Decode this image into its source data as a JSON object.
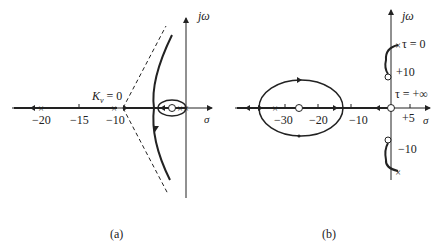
{
  "figure": {
    "type": "root-locus-diagrams",
    "panels": [
      {
        "id": "a",
        "caption": "(a)",
        "axis_labels": {
          "real": "σ",
          "imag": "jω"
        },
        "tick_labels": [
          "−20",
          "−15",
          "−10"
        ],
        "annotations": {
          "gain_start": "K_v = 0",
          "gain_symbol": "K",
          "gain_subscript": "v",
          "gain_value": "= 0"
        },
        "poles": [
          -20,
          -10,
          -1.5,
          0
        ],
        "zeros": [
          -3
        ],
        "features": [
          "dashed asymptotes from approx -9.5",
          "locus branches approaching asymptotes",
          "small closed loop around zero near origin"
        ]
      },
      {
        "id": "b",
        "caption": "(b)",
        "axis_labels": {
          "real": "σ",
          "imag": "jω"
        },
        "tick_labels": [
          "−30",
          "−20",
          "−10",
          "+5",
          "+10",
          "−10"
        ],
        "annotations": {
          "tau_zero": "τ = 0",
          "tau_inf": "τ = +∞"
        },
        "poles": [
          -32,
          "j13",
          "-j13"
        ],
        "zeros": [
          -26,
          0,
          "j10",
          "-j10"
        ],
        "features": [
          "elliptical locus from approx -35 to -12 on real axis",
          "arcs from poles at ±j13 to zeros at ±j10"
        ]
      }
    ]
  }
}
